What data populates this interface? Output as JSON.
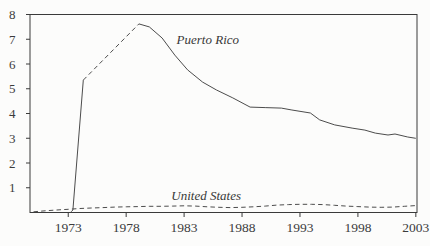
{
  "figure": {
    "background": "#fcfcfb",
    "axis_color": "#3a3a3a",
    "ink_color": "#3b3b3b"
  },
  "chart_data": {
    "type": "line",
    "title": "",
    "xlabel": "",
    "ylabel": "",
    "xlim": [
      1969.7,
      2003.1
    ],
    "ylim": [
      0,
      8
    ],
    "x_ticks": [
      "1973",
      "1978",
      "1983",
      "1988",
      "1993",
      "1998",
      "2003"
    ],
    "x_tick_values": [
      1973,
      1978,
      1983,
      1988,
      1993,
      1998,
      2003
    ],
    "y_ticks": [
      "1",
      "2",
      "3",
      "4",
      "5",
      "6",
      "7",
      "8"
    ],
    "y_tick_values": [
      1,
      2,
      3,
      4,
      5,
      6,
      7,
      8
    ],
    "grid": false,
    "box": true,
    "legend_position": "inline-annotations",
    "series": [
      {
        "name": "Puerto Rico",
        "color": "#4c4c4c",
        "annotation": {
          "text": "Puerto Rico",
          "x": 1982.35,
          "y": 7.0
        },
        "segments": [
          {
            "dash": "solid",
            "points": [
              [
                1973.25,
                0.03
              ],
              [
                1973.4,
                0.1
              ],
              [
                1974.3,
                5.35
              ]
            ]
          },
          {
            "dash": "dashed",
            "points": [
              [
                1974.3,
                5.35
              ],
              [
                1979.1,
                7.62
              ]
            ]
          },
          {
            "dash": "solid",
            "points": [
              [
                1979.1,
                7.62
              ],
              [
                1980.0,
                7.5
              ],
              [
                1981.1,
                7.05
              ],
              [
                1982.2,
                6.36
              ],
              [
                1983.3,
                5.76
              ],
              [
                1984.6,
                5.27
              ],
              [
                1985.8,
                4.95
              ],
              [
                1987.2,
                4.63
              ],
              [
                1988.7,
                4.26
              ],
              [
                1990.0,
                4.24
              ],
              [
                1991.4,
                4.22
              ],
              [
                1992.3,
                4.14
              ],
              [
                1993.9,
                4.02
              ],
              [
                1994.7,
                3.74
              ],
              [
                1996.0,
                3.54
              ],
              [
                1997.5,
                3.41
              ],
              [
                1998.6,
                3.33
              ],
              [
                1999.5,
                3.21
              ],
              [
                2000.6,
                3.13
              ],
              [
                2001.2,
                3.17
              ],
              [
                2002.3,
                3.05
              ],
              [
                2003.0,
                3.0
              ]
            ]
          }
        ]
      },
      {
        "name": "United States",
        "color": "#4c4c4c",
        "annotation": {
          "text": "United States",
          "x": 1981.9,
          "y": 0.68
        },
        "segments": [
          {
            "dash": "dashed",
            "points": [
              [
                1970,
                0.03
              ],
              [
                1971,
                0.07
              ],
              [
                1972,
                0.1
              ],
              [
                1973,
                0.13
              ],
              [
                1974,
                0.16
              ],
              [
                1975,
                0.18
              ],
              [
                1976,
                0.2
              ],
              [
                1977,
                0.22
              ],
              [
                1978,
                0.23
              ],
              [
                1979,
                0.24
              ],
              [
                1980,
                0.25
              ],
              [
                1981,
                0.25
              ],
              [
                1982,
                0.26
              ],
              [
                1983,
                0.27
              ],
              [
                1984,
                0.26
              ],
              [
                1985,
                0.23
              ],
              [
                1986,
                0.21
              ],
              [
                1987,
                0.2
              ],
              [
                1988,
                0.21
              ],
              [
                1989,
                0.23
              ],
              [
                1990,
                0.26
              ],
              [
                1991,
                0.3
              ],
              [
                1992,
                0.32
              ],
              [
                1993,
                0.33
              ],
              [
                1994,
                0.33
              ],
              [
                1995,
                0.32
              ],
              [
                1996,
                0.29
              ],
              [
                1997,
                0.26
              ],
              [
                1998,
                0.24
              ],
              [
                1999,
                0.22
              ],
              [
                2000,
                0.21
              ],
              [
                2001,
                0.22
              ],
              [
                2002,
                0.25
              ],
              [
                2003,
                0.28
              ]
            ]
          }
        ]
      }
    ]
  }
}
